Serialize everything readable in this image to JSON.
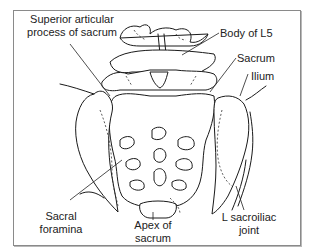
{
  "figure": {
    "labels": {
      "superior_articular_line1": "Superior articular",
      "superior_articular_line2": "process of sacrum",
      "body_l5": "Body of L5",
      "sacrum": "Sacrum",
      "ilium": "Ilium",
      "sacral_foramina_line1": "Sacral",
      "sacral_foramina_line2": "foramina",
      "apex_line1": "Apex of",
      "apex_line2": "sacrum",
      "sacroiliac_line1": "L sacroiliac",
      "sacroiliac_line2": "joint"
    }
  }
}
